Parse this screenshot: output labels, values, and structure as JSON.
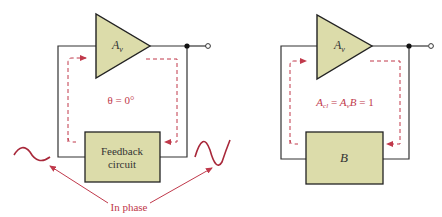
{
  "colors": {
    "block_fill": "#dcdcaa",
    "wire": "#333333",
    "loop": "#c0394b",
    "background": "#ffffff"
  },
  "left_circuit": {
    "amplifier": {
      "label_main": "A",
      "label_sub": "v"
    },
    "phase_label": "θ = 0°",
    "feedback_block": {
      "line1": "Feedback",
      "line2": "circuit"
    },
    "annotation": "In phase"
  },
  "right_circuit": {
    "amplifier": {
      "label_main": "A",
      "label_sub": "v"
    },
    "equation": {
      "lhs_main": "A",
      "lhs_sub": "cl",
      "eq1": " = ",
      "mid_main": "A",
      "mid_sub": "v",
      "mid_tail": "B",
      "eq2": " = 1"
    },
    "feedback_block": {
      "label": "B"
    }
  }
}
